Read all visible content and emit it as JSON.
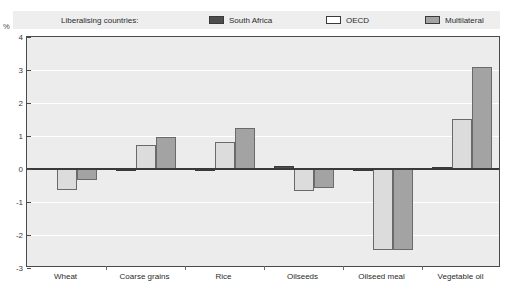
{
  "title_strip": "",
  "axis_unit": "%",
  "legend": {
    "title": "Liberalising countries:",
    "items": [
      {
        "label": "South Africa",
        "color": "#4d4d4d",
        "swatch": "legend-swatch-south-africa"
      },
      {
        "label": "OECD",
        "color": "#dcdcdc",
        "swatch": "legend-swatch-oecd"
      },
      {
        "label": "Multilateral",
        "color": "#a3a3a3",
        "swatch": "legend-swatch-multilateral"
      }
    ]
  },
  "chart_data": {
    "type": "bar",
    "title": "",
    "xlabel": "",
    "ylabel": "%",
    "ylim": [
      -3,
      4
    ],
    "yticks": [
      4,
      3,
      2,
      1,
      0,
      -1,
      -2,
      -3
    ],
    "ytick_labels": [
      "4",
      "3",
      "2",
      "1",
      "0",
      "-1",
      "-2",
      "-3"
    ],
    "grid": true,
    "legend_position": "top",
    "categories": [
      "Wheat",
      "Coarse grains",
      "Rice",
      "Oilseeds",
      "Oilseed meal",
      "Vegetable oil"
    ],
    "series": [
      {
        "name": "South Africa",
        "color": "#4d4d4d",
        "values": [
          0.02,
          0.0,
          -0.05,
          0.08,
          -0.02,
          0.05
        ]
      },
      {
        "name": "OECD",
        "color": "#dcdcdc",
        "values": [
          -0.65,
          0.72,
          0.82,
          -0.68,
          -2.45,
          1.52
        ]
      },
      {
        "name": "Multilateral",
        "color": "#a3a3a3",
        "values": [
          -0.32,
          0.98,
          1.25,
          -0.58,
          -2.45,
          3.1
        ]
      }
    ]
  }
}
